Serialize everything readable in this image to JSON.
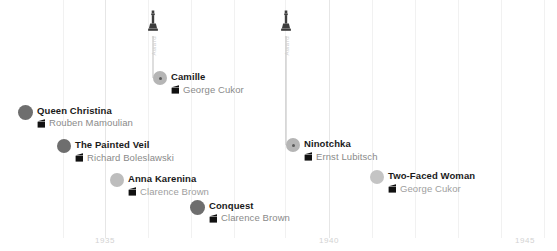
{
  "chart_data": {
    "type": "scatter",
    "title": "",
    "xlabel": "",
    "ylabel": "",
    "xlim": [
      1933.1,
      1945.4
    ],
    "grid": true,
    "legend_position": "none",
    "axis_ticks": [
      {
        "label": "1935",
        "value": 1935,
        "x": 105
      },
      {
        "label": "1940",
        "value": 1940,
        "x": 329
      },
      {
        "label": "1945",
        "value": 1945,
        "x": 525
      }
    ],
    "gridlines_x": [
      63,
      105,
      148,
      191,
      234,
      285,
      329,
      372,
      415,
      458,
      501,
      544
    ],
    "awards": [
      {
        "label": "Award",
        "icon": "oscar-statuette-icon",
        "x": 153,
        "year": 1937,
        "film": "Camille",
        "stem_top": 36,
        "stem_bottom": 78
      },
      {
        "label": "Award",
        "icon": "oscar-statuette-icon",
        "x": 286,
        "year": 1939,
        "film": "Ninotchka",
        "stem_top": 36,
        "stem_bottom": 145
      }
    ],
    "points": [
      {
        "title": "Queen Christina",
        "director": "Rouben Mamoulian",
        "year": 1933,
        "x": 18,
        "y": 112,
        "dot_size": 15,
        "dot_color": "#6e6e6e",
        "awarded": false,
        "icon": "clapperboard-icon"
      },
      {
        "title": "Camille",
        "director": "George Cukor",
        "year": 1937,
        "x": 153,
        "y": 78,
        "dot_size": 14,
        "dot_color": "#b5b5b5",
        "awarded": true,
        "icon": "clapperboard-icon"
      },
      {
        "title": "The Painted Veil",
        "director": "Richard Boleslawski",
        "year": 1934,
        "x": 57,
        "y": 146,
        "dot_size": 14,
        "dot_color": "#6e6e6e",
        "awarded": false,
        "icon": "clapperboard-icon"
      },
      {
        "title": "Ninotchka",
        "director": "Ernst Lubitsch",
        "year": 1939,
        "x": 286,
        "y": 145,
        "dot_size": 14,
        "dot_color": "#b5b5b5",
        "awarded": true,
        "icon": "clapperboard-icon"
      },
      {
        "title": "Anna Karenina",
        "director": "Clarence Brown",
        "year": 1935,
        "x": 110,
        "y": 180,
        "dot_size": 14,
        "dot_color": "#bdbdbd",
        "awarded": false,
        "icon": "clapperboard-icon"
      },
      {
        "title": "Two-Faced Woman",
        "director": "George Cukor",
        "year": 1941,
        "x": 370,
        "y": 177,
        "dot_size": 14,
        "dot_color": "#c4c4c4",
        "awarded": false,
        "icon": "clapperboard-icon"
      },
      {
        "title": "Conquest",
        "director": "Clarence Brown",
        "year": 1937,
        "x": 190,
        "y": 207,
        "dot_size": 15,
        "dot_color": "#6e6e6e",
        "awarded": false,
        "icon": "clapperboard-icon"
      }
    ],
    "colors": {
      "dot_dark": "#6e6e6e",
      "dot_light": "#b5b5b5",
      "title_text": "#1a1a1a",
      "director_text": "#8a8a8a",
      "gridline": "#f1f1f1",
      "axis_label": "#d2d2d2",
      "award_text": "#cccccc",
      "statuette": "#3d3d3d",
      "background": "#ffffff"
    }
  }
}
